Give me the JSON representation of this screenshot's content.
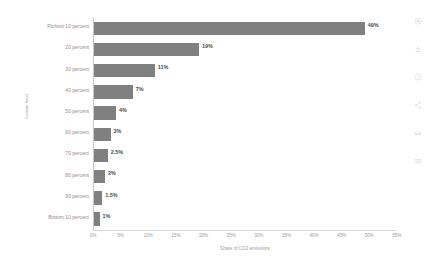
{
  "chart_data": {
    "type": "bar",
    "orientation": "horizontal",
    "title": "",
    "subtitle": "",
    "xlabel": "Share of CO2 emissions",
    "ylabel": "Income level",
    "categories": [
      "Richest 10 percent",
      "20 percent",
      "30 percent",
      "40 percent",
      "50 percent",
      "60 percent",
      "70 percent",
      "80 percent",
      "90 percent",
      "Bottom 10 percent"
    ],
    "values": [
      49,
      19,
      11,
      7,
      4,
      3,
      2.5,
      2,
      1.5,
      1
    ],
    "value_labels": [
      "49%",
      "19%",
      "11%",
      "7%",
      "4%",
      "3%",
      "2.5%",
      "2%",
      "1.5%",
      "1%"
    ],
    "xlim": [
      0,
      55
    ],
    "xticks": [
      0,
      5,
      10,
      15,
      20,
      25,
      30,
      35,
      40,
      45,
      50,
      55
    ],
    "xtick_labels": [
      "0%",
      "5%",
      "10%",
      "15%",
      "20%",
      "25%",
      "30%",
      "35%",
      "40%",
      "45%",
      "50%",
      "55%"
    ],
    "grid": false,
    "legend": false,
    "bar_color": "#808080",
    "axis_color": "#c8c8c8",
    "label_color": "#8e8e8e",
    "value_label_color": "#4a4a4a"
  },
  "icon_rail": {
    "items": [
      {
        "name": "settings-icon"
      },
      {
        "name": "download-icon"
      },
      {
        "name": "info-icon"
      },
      {
        "name": "share-icon"
      },
      {
        "name": "quote-icon"
      },
      {
        "name": "menu-icon"
      }
    ]
  }
}
